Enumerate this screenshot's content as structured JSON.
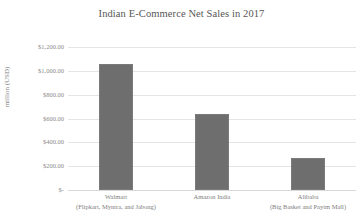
{
  "chart_data": {
    "type": "bar",
    "title": "Indian E-Commerce Net Sales in 2017",
    "xlabel": "",
    "ylabel": "million (USD)",
    "categories": [
      "Walmart",
      "Amazon India",
      "Alibaba"
    ],
    "category_sublabels": [
      "(Flipkart, Myntra, and Jabong)",
      "",
      "(Big Basket and Paytm Mall)"
    ],
    "values": [
      1055,
      635,
      265
    ],
    "ylim": [
      0,
      1200
    ],
    "ytick_values": [
      1200,
      1000,
      800,
      600,
      400,
      200,
      0
    ],
    "ytick_labels": [
      "$1,200.00",
      "$1,000.00",
      "$800.00",
      "$600.00",
      "$400.00",
      "$200.00",
      "$-"
    ],
    "grid": true,
    "legend": false,
    "bar_color": "#6e6e6e",
    "grid_color": "#e4e4e4",
    "background_color": "#ffffff",
    "text_color": "#7e7e7e"
  }
}
